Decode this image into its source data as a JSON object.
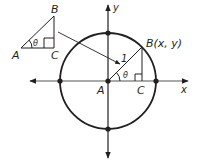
{
  "diagram": {
    "type": "unit-circle",
    "colors": {
      "circle": "#231f20",
      "axes": "#555555",
      "text": "#231f20",
      "background": "#ffffff"
    },
    "small_triangle": {
      "vertex_a": "A",
      "vertex_b": "B",
      "vertex_c": "C",
      "angle": "θ"
    },
    "unit_circle": {
      "center_label": "A",
      "point_label": "B(x, y)",
      "foot_label": "C",
      "radius_label": "1",
      "angle": "θ",
      "x_axis_label": "x",
      "y_axis_label": "y"
    }
  }
}
